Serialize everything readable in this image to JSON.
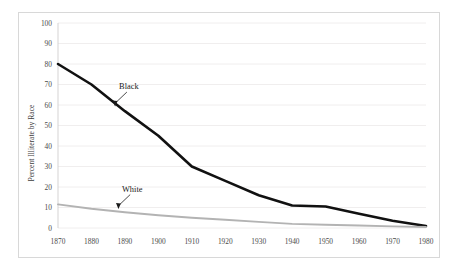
{
  "chart_data": {
    "type": "line",
    "title": "",
    "xlabel": "",
    "ylabel": "Percent Illiterate by Race",
    "x": [
      1870,
      1880,
      1890,
      1900,
      1910,
      1920,
      1930,
      1940,
      1950,
      1960,
      1970,
      1980
    ],
    "xlim": [
      1870,
      1980
    ],
    "ylim": [
      0,
      100
    ],
    "xticks": [
      "1870",
      "1880",
      "1890",
      "1900",
      "1910",
      "1920",
      "1930",
      "1940",
      "1950",
      "1960",
      "1970",
      "1980"
    ],
    "yticks": [
      "0",
      "10",
      "20",
      "30",
      "40",
      "50",
      "60",
      "70",
      "80",
      "90",
      "100"
    ],
    "grid": "horizontal",
    "legend": "inline-annotations",
    "series": [
      {
        "name": "Black",
        "color": "#111111",
        "values": [
          80,
          70,
          57,
          45,
          30,
          23,
          16,
          11,
          10.5,
          7,
          3.5,
          1
        ]
      },
      {
        "name": "White",
        "color": "#b3b3b3",
        "values": [
          11.5,
          9.4,
          7.7,
          6.2,
          5.0,
          4.0,
          3.0,
          2.0,
          1.6,
          1.2,
          0.8,
          0.5
        ]
      }
    ],
    "annotations": [
      {
        "label": "Black",
        "points_to_year": 1887,
        "points_to_value": 59
      },
      {
        "label": "White",
        "points_to_year": 1888,
        "points_to_value": 9
      }
    ]
  }
}
